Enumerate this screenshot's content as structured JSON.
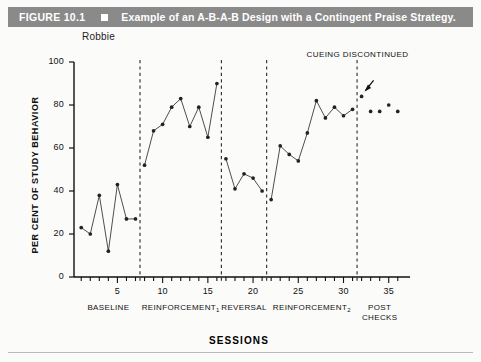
{
  "header": {
    "figure_number": "FIGURE 10.1",
    "marker_icon": "filled-square-icon",
    "title": "Example of an A-B-A-B Design with a Contingent Praise Strategy.",
    "bar_color": "#8a8a8a",
    "text_color": "#ffffff"
  },
  "subject": {
    "label": "Robbie"
  },
  "annotation": {
    "text": "CUEING DISCONTINUED",
    "arrow_icon": "arrow-down-left-icon"
  },
  "chart_data": {
    "type": "line",
    "title": "Example of an A-B-A-B Design with a Contingent Praise Strategy.",
    "subject": "Robbie",
    "xlabel": "SESSIONS",
    "ylabel": "PER CENT OF STUDY BEHAVIOR",
    "xlim": [
      0.2,
      36.8
    ],
    "ylim": [
      0,
      100
    ],
    "ytick_values": [
      0,
      20,
      40,
      60,
      80,
      100
    ],
    "ytick_labels": [
      "0",
      "20",
      "40",
      "60",
      "80",
      "100"
    ],
    "xtick_values": [
      5,
      10,
      15,
      20,
      25,
      30,
      35
    ],
    "xtick_labels": [
      "5",
      "10",
      "15",
      "20",
      "25",
      "30",
      "35"
    ],
    "xtick_minor_every": 1,
    "grid": false,
    "legend": "none",
    "marker": "filled-circle",
    "line_color": "#444444",
    "marker_color": "#222222",
    "x": [
      1,
      2,
      3,
      4,
      5,
      6,
      7,
      8,
      9,
      10,
      11,
      12,
      13,
      14,
      15,
      16,
      17,
      18,
      19,
      20,
      21,
      22,
      23,
      24,
      25,
      26,
      27,
      28,
      29,
      30,
      31,
      32,
      33,
      34,
      35,
      36
    ],
    "values": [
      23,
      20,
      38,
      12,
      43,
      27,
      27,
      52,
      68,
      71,
      79,
      83,
      70,
      79,
      65,
      90,
      55,
      41,
      48,
      46,
      40,
      36,
      61,
      57,
      54,
      67,
      82,
      74,
      79,
      75,
      78,
      84,
      77,
      77,
      80,
      77
    ],
    "segments": [
      {
        "name": "BASELINE",
        "x_start": 1,
        "x_end": 7,
        "connected": true,
        "x": [
          1,
          2,
          3,
          4,
          5,
          6,
          7
        ],
        "values": [
          23,
          20,
          38,
          12,
          43,
          27,
          27
        ]
      },
      {
        "name": "REINFORCEMENT1",
        "x_start": 8,
        "x_end": 16,
        "connected": true,
        "x": [
          8,
          9,
          10,
          11,
          12,
          13,
          14,
          15,
          16
        ],
        "values": [
          52,
          68,
          71,
          79,
          83,
          70,
          79,
          65,
          90
        ]
      },
      {
        "name": "REVERSAL",
        "x_start": 17,
        "x_end": 21,
        "connected": true,
        "x": [
          17,
          18,
          19,
          20,
          21
        ],
        "values": [
          55,
          41,
          48,
          46,
          40
        ]
      },
      {
        "name": "REINFORCEMENT2",
        "x_start": 22,
        "x_end": 31,
        "connected": true,
        "x": [
          22,
          23,
          24,
          25,
          26,
          27,
          28,
          29,
          30,
          31
        ],
        "values": [
          36,
          61,
          57,
          54,
          67,
          82,
          74,
          79,
          75,
          78
        ]
      },
      {
        "name": "POST CHECKS",
        "x_start": 32,
        "x_end": 36,
        "connected": false,
        "x": [
          32,
          33,
          34,
          35,
          36
        ],
        "values": [
          84,
          77,
          77,
          80,
          77
        ]
      }
    ],
    "phase_dividers": [
      7.5,
      16.5,
      21.5,
      31.5
    ],
    "phase_labels": [
      {
        "label": "BASELINE",
        "subscript": "",
        "center_x": 4.0
      },
      {
        "label": "REINFORCEMENT",
        "subscript": "1",
        "center_x": 12.0
      },
      {
        "label": "REVERSAL",
        "subscript": "",
        "center_x": 19.0
      },
      {
        "label": "REINFORCEMENT",
        "subscript": "2",
        "center_x": 26.5
      },
      {
        "label": "POST CHECKS",
        "subscript": "",
        "center_x": 34.0
      }
    ],
    "annotations": [
      {
        "text": "CUEING DISCONTINUED",
        "target_x": 32,
        "target_y": 84
      }
    ]
  }
}
